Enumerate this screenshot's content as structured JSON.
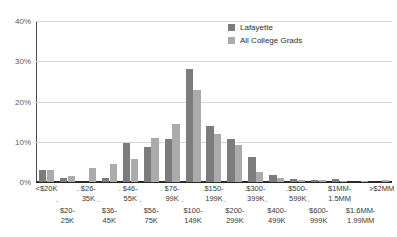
{
  "chart_data": {
    "type": "bar",
    "title": "",
    "subtitle": "",
    "xlabel": "",
    "ylabel": "",
    "ylim": [
      0,
      40
    ],
    "yticks": [
      0,
      10,
      20,
      30,
      40
    ],
    "ytick_labels": [
      "0%",
      "10%",
      "20%",
      "30%",
      "40%"
    ],
    "grid": true,
    "legend_position": "top-right",
    "categories": [
      "<$20K",
      "$20-25K",
      "$26-35K",
      "$36-45K",
      "$46-55K",
      "$56-75K",
      "$76-99K",
      "$100-149K",
      "$150-199K",
      "$200-299K",
      "$300-399K",
      "$400-499K",
      "$500-599K",
      "$600-999K",
      "$1MM-1.5MM",
      "$1.6MM-1.99MM",
      ">$2MM"
    ],
    "category_lines": [
      [
        "<$20K"
      ],
      [
        "$20-",
        "25K"
      ],
      [
        "$26-",
        "35K"
      ],
      [
        "$36-",
        "45K"
      ],
      [
        "$46-",
        "55K"
      ],
      [
        "$56-",
        "75K"
      ],
      [
        "$76-",
        "99K"
      ],
      [
        "$100-",
        "149K"
      ],
      [
        "$150-",
        "199K"
      ],
      [
        "$200-",
        "299K"
      ],
      [
        "$300-",
        "399K"
      ],
      [
        "$400-",
        "499K"
      ],
      [
        "$500-",
        "599K"
      ],
      [
        "$600-",
        "999K"
      ],
      [
        "$1MM-",
        "1.5MM"
      ],
      [
        "$1.6MM-",
        "1.99MM"
      ],
      [
        ">$2MM"
      ]
    ],
    "series": [
      {
        "name": "Lafayette",
        "color": "#7c7c7c",
        "values": [
          3.0,
          0.9,
          0.0,
          0.9,
          9.7,
          8.6,
          10.7,
          28.2,
          14.0,
          10.6,
          6.2,
          1.8,
          0.7,
          0.6,
          0.7,
          0.0,
          0.0
        ]
      },
      {
        "name": "All College Grads",
        "color": "#ababab",
        "values": [
          2.9,
          1.6,
          3.4,
          4.6,
          5.8,
          11.0,
          14.4,
          22.8,
          12.0,
          9.1,
          2.4,
          1.0,
          0.5,
          0.5,
          0.3,
          0.2,
          0.4
        ]
      }
    ]
  },
  "legend": {
    "items": [
      {
        "label": "Lafayette"
      },
      {
        "label": "All College Grads"
      }
    ]
  },
  "separator": "-"
}
